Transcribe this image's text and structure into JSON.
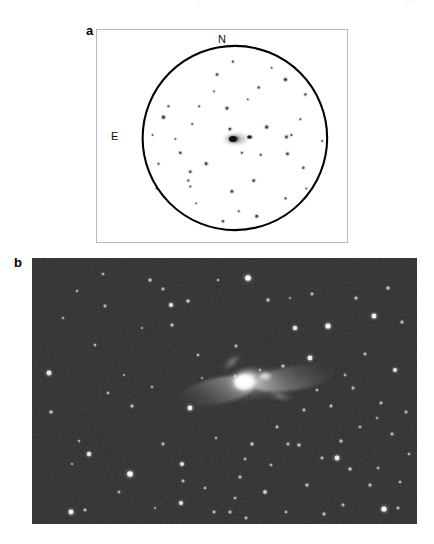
{
  "figure": {
    "kind": "astronomical-two-panel-figure",
    "page_header_center": "2",
    "page_header_right": "475",
    "background_color": "#ffffff"
  },
  "panel_a": {
    "letter": "a",
    "type": "finder-chart",
    "background_color": "#ffffff",
    "frame_color": "#b9b9b9",
    "circle_color": "#000000",
    "star_color": "#3a3a3a",
    "compass": {
      "north_label": "N",
      "east_label": "E"
    },
    "aperture_circle": {
      "cx": 139,
      "cy": 109,
      "r": 93
    },
    "central_object": {
      "name": "galaxy-pair",
      "cx": 140,
      "cy": 110,
      "companion_dx": 14,
      "companion_dy": -2
    },
    "stars": [
      {
        "x": 137,
        "y": 32,
        "r": 1.1
      },
      {
        "x": 121,
        "y": 45,
        "r": 1.3
      },
      {
        "x": 163,
        "y": 58,
        "r": 1.2
      },
      {
        "x": 190,
        "y": 50,
        "r": 1.6
      },
      {
        "x": 210,
        "y": 65,
        "r": 1.2
      },
      {
        "x": 103,
        "y": 77,
        "r": 1.0
      },
      {
        "x": 72,
        "y": 77,
        "r": 1.1
      },
      {
        "x": 67,
        "y": 88,
        "r": 1.6
      },
      {
        "x": 131,
        "y": 79,
        "r": 1.4
      },
      {
        "x": 96,
        "y": 95,
        "r": 1.0
      },
      {
        "x": 171,
        "y": 98,
        "r": 1.6
      },
      {
        "x": 134,
        "y": 100,
        "r": 1.4
      },
      {
        "x": 191,
        "y": 108,
        "r": 1.4
      },
      {
        "x": 196,
        "y": 106,
        "r": 1.1
      },
      {
        "x": 146,
        "y": 124,
        "r": 1.1
      },
      {
        "x": 192,
        "y": 125,
        "r": 1.4
      },
      {
        "x": 84,
        "y": 124,
        "r": 1.3
      },
      {
        "x": 165,
        "y": 126,
        "r": 1.1
      },
      {
        "x": 110,
        "y": 135,
        "r": 1.5
      },
      {
        "x": 62,
        "y": 135,
        "r": 1.1
      },
      {
        "x": 94,
        "y": 143,
        "r": 1.3
      },
      {
        "x": 208,
        "y": 139,
        "r": 1.2
      },
      {
        "x": 92,
        "y": 152,
        "r": 1.1
      },
      {
        "x": 158,
        "y": 152,
        "r": 1.4
      },
      {
        "x": 94,
        "y": 158,
        "r": 1.0
      },
      {
        "x": 136,
        "y": 163,
        "r": 1.4
      },
      {
        "x": 190,
        "y": 170,
        "r": 1.1
      },
      {
        "x": 143,
        "y": 183,
        "r": 1.0
      },
      {
        "x": 127,
        "y": 193,
        "r": 1.2
      },
      {
        "x": 161,
        "y": 188,
        "r": 1.4
      },
      {
        "x": 56,
        "y": 106,
        "r": 0.9
      },
      {
        "x": 79,
        "y": 110,
        "r": 0.9
      },
      {
        "x": 227,
        "y": 112,
        "r": 1.0
      },
      {
        "x": 118,
        "y": 62,
        "r": 0.9
      },
      {
        "x": 152,
        "y": 70,
        "r": 0.9
      },
      {
        "x": 205,
        "y": 90,
        "r": 1.0
      },
      {
        "x": 60,
        "y": 160,
        "r": 0.9
      },
      {
        "x": 211,
        "y": 160,
        "r": 0.9
      },
      {
        "x": 100,
        "y": 175,
        "r": 0.9
      },
      {
        "x": 176,
        "y": 38,
        "r": 0.9
      }
    ]
  },
  "panel_b": {
    "letter": "b",
    "type": "ccd-image",
    "background_color": "#2c2c2c",
    "star_color": "#ffffff",
    "nebula_color": "#f5f5f5",
    "central_object": {
      "name": "merging-galaxy-system",
      "cx": 222,
      "cy": 126
    },
    "stars": [
      {
        "x": 17,
        "y": 115,
        "r": 2.4,
        "b": 0.85
      },
      {
        "x": 19,
        "y": 154,
        "r": 1.6,
        "b": 0.6
      },
      {
        "x": 45,
        "y": 33,
        "r": 1.2,
        "b": 0.5
      },
      {
        "x": 53,
        "y": 252,
        "r": 1.4,
        "b": 0.55
      },
      {
        "x": 57,
        "y": 196,
        "r": 2.2,
        "b": 0.8
      },
      {
        "x": 63,
        "y": 87,
        "r": 1.3,
        "b": 0.52
      },
      {
        "x": 71,
        "y": 16,
        "r": 1.3,
        "b": 0.5
      },
      {
        "x": 73,
        "y": 48,
        "r": 1.4,
        "b": 0.55
      },
      {
        "x": 76,
        "y": 135,
        "r": 1.3,
        "b": 0.52
      },
      {
        "x": 39,
        "y": 254,
        "r": 2.4,
        "b": 0.9
      },
      {
        "x": 47,
        "y": 183,
        "r": 1.2,
        "b": 0.48
      },
      {
        "x": 98,
        "y": 216,
        "r": 2.8,
        "b": 0.95
      },
      {
        "x": 100,
        "y": 148,
        "r": 1.5,
        "b": 0.58
      },
      {
        "x": 118,
        "y": 22,
        "r": 1.6,
        "b": 0.6
      },
      {
        "x": 120,
        "y": 129,
        "r": 1.2,
        "b": 0.48
      },
      {
        "x": 87,
        "y": 234,
        "r": 1.3,
        "b": 0.52
      },
      {
        "x": 131,
        "y": 186,
        "r": 1.4,
        "b": 0.55
      },
      {
        "x": 139,
        "y": 47,
        "r": 2.0,
        "b": 0.8
      },
      {
        "x": 140,
        "y": 67,
        "r": 1.5,
        "b": 0.58
      },
      {
        "x": 131,
        "y": 31,
        "r": 1.4,
        "b": 0.55
      },
      {
        "x": 156,
        "y": 43,
        "r": 1.6,
        "b": 0.65
      },
      {
        "x": 158,
        "y": 150,
        "r": 2.4,
        "b": 0.88
      },
      {
        "x": 150,
        "y": 206,
        "r": 2.0,
        "b": 0.78
      },
      {
        "x": 151,
        "y": 223,
        "r": 1.4,
        "b": 0.55
      },
      {
        "x": 149,
        "y": 245,
        "r": 2.0,
        "b": 0.8
      },
      {
        "x": 166,
        "y": 97,
        "r": 1.3,
        "b": 0.5
      },
      {
        "x": 173,
        "y": 230,
        "r": 1.3,
        "b": 0.52
      },
      {
        "x": 184,
        "y": 180,
        "r": 1.2,
        "b": 0.48
      },
      {
        "x": 182,
        "y": 254,
        "r": 1.4,
        "b": 0.55
      },
      {
        "x": 186,
        "y": 22,
        "r": 1.2,
        "b": 0.5
      },
      {
        "x": 198,
        "y": 254,
        "r": 1.5,
        "b": 0.58
      },
      {
        "x": 204,
        "y": 88,
        "r": 1.4,
        "b": 0.55
      },
      {
        "x": 216,
        "y": 20,
        "r": 2.8,
        "b": 0.98
      },
      {
        "x": 220,
        "y": 186,
        "r": 1.6,
        "b": 0.62
      },
      {
        "x": 213,
        "y": 201,
        "r": 1.3,
        "b": 0.52
      },
      {
        "x": 208,
        "y": 219,
        "r": 1.5,
        "b": 0.58
      },
      {
        "x": 203,
        "y": 240,
        "r": 1.3,
        "b": 0.52
      },
      {
        "x": 214,
        "y": 260,
        "r": 1.4,
        "b": 0.54
      },
      {
        "x": 233,
        "y": 234,
        "r": 1.8,
        "b": 0.72
      },
      {
        "x": 236,
        "y": 42,
        "r": 1.6,
        "b": 0.62
      },
      {
        "x": 239,
        "y": 207,
        "r": 1.3,
        "b": 0.52
      },
      {
        "x": 245,
        "y": 169,
        "r": 1.4,
        "b": 0.55
      },
      {
        "x": 251,
        "y": 108,
        "r": 1.5,
        "b": 0.58
      },
      {
        "x": 254,
        "y": 254,
        "r": 1.3,
        "b": 0.5
      },
      {
        "x": 256,
        "y": 186,
        "r": 1.4,
        "b": 0.54
      },
      {
        "x": 263,
        "y": 70,
        "r": 2.2,
        "b": 0.82
      },
      {
        "x": 267,
        "y": 187,
        "r": 1.6,
        "b": 0.62
      },
      {
        "x": 272,
        "y": 152,
        "r": 1.4,
        "b": 0.55
      },
      {
        "x": 275,
        "y": 227,
        "r": 1.5,
        "b": 0.58
      },
      {
        "x": 278,
        "y": 100,
        "r": 2.4,
        "b": 0.88
      },
      {
        "x": 280,
        "y": 36,
        "r": 1.4,
        "b": 0.55
      },
      {
        "x": 285,
        "y": 132,
        "r": 1.3,
        "b": 0.52
      },
      {
        "x": 290,
        "y": 200,
        "r": 1.4,
        "b": 0.54
      },
      {
        "x": 292,
        "y": 256,
        "r": 1.5,
        "b": 0.58
      },
      {
        "x": 296,
        "y": 68,
        "r": 2.6,
        "b": 0.92
      },
      {
        "x": 299,
        "y": 148,
        "r": 1.4,
        "b": 0.55
      },
      {
        "x": 305,
        "y": 200,
        "r": 2.4,
        "b": 0.86
      },
      {
        "x": 309,
        "y": 183,
        "r": 1.5,
        "b": 0.58
      },
      {
        "x": 311,
        "y": 247,
        "r": 1.4,
        "b": 0.54
      },
      {
        "x": 313,
        "y": 117,
        "r": 1.3,
        "b": 0.5
      },
      {
        "x": 318,
        "y": 211,
        "r": 1.6,
        "b": 0.62
      },
      {
        "x": 321,
        "y": 130,
        "r": 1.4,
        "b": 0.55
      },
      {
        "x": 324,
        "y": 40,
        "r": 1.5,
        "b": 0.58
      },
      {
        "x": 328,
        "y": 169,
        "r": 1.3,
        "b": 0.52
      },
      {
        "x": 333,
        "y": 96,
        "r": 1.4,
        "b": 0.54
      },
      {
        "x": 338,
        "y": 227,
        "r": 1.5,
        "b": 0.58
      },
      {
        "x": 342,
        "y": 58,
        "r": 2.4,
        "b": 0.88
      },
      {
        "x": 346,
        "y": 210,
        "r": 1.3,
        "b": 0.5
      },
      {
        "x": 349,
        "y": 145,
        "r": 1.4,
        "b": 0.55
      },
      {
        "x": 352,
        "y": 251,
        "r": 2.6,
        "b": 0.92
      },
      {
        "x": 356,
        "y": 30,
        "r": 1.6,
        "b": 0.62
      },
      {
        "x": 360,
        "y": 176,
        "r": 1.4,
        "b": 0.55
      },
      {
        "x": 363,
        "y": 112,
        "r": 2.0,
        "b": 0.78
      },
      {
        "x": 368,
        "y": 224,
        "r": 1.3,
        "b": 0.52
      },
      {
        "x": 370,
        "y": 64,
        "r": 1.5,
        "b": 0.58
      },
      {
        "x": 374,
        "y": 154,
        "r": 1.4,
        "b": 0.55
      },
      {
        "x": 377,
        "y": 196,
        "r": 1.3,
        "b": 0.5
      },
      {
        "x": 366,
        "y": 250,
        "r": 1.4,
        "b": 0.54
      },
      {
        "x": 345,
        "y": 160,
        "r": 1.2,
        "b": 0.46
      },
      {
        "x": 228,
        "y": 112,
        "r": 1.2,
        "b": 0.46
      },
      {
        "x": 203,
        "y": 118,
        "r": 1.2,
        "b": 0.46
      },
      {
        "x": 110,
        "y": 70,
        "r": 1.1,
        "b": 0.44
      },
      {
        "x": 92,
        "y": 117,
        "r": 1.1,
        "b": 0.44
      },
      {
        "x": 170,
        "y": 120,
        "r": 1.1,
        "b": 0.44
      },
      {
        "x": 258,
        "y": 40,
        "r": 1.1,
        "b": 0.44
      },
      {
        "x": 31,
        "y": 60,
        "r": 1.2,
        "b": 0.46
      },
      {
        "x": 40,
        "y": 206,
        "r": 1.1,
        "b": 0.44
      },
      {
        "x": 123,
        "y": 250,
        "r": 1.1,
        "b": 0.44
      }
    ]
  }
}
